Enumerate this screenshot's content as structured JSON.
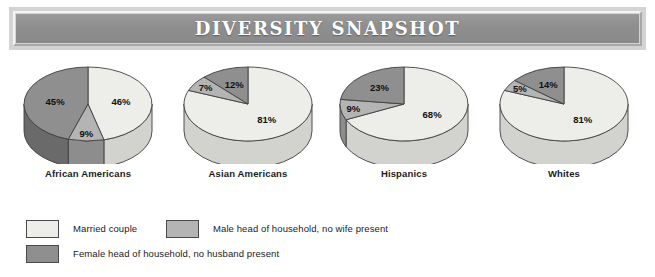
{
  "banner": {
    "title": "DIVERSITY SNAPSHOT"
  },
  "colors": {
    "married_couple": "#ededea",
    "male_head": "#b4b4b4",
    "female_head": "#8f8f8f",
    "married_couple_side": "#d2d2cf",
    "male_head_side": "#8d8d8d",
    "female_head_side": "#6a6a6a",
    "outline": "#3f3f3f",
    "banner_fill": "#8e8e8e",
    "banner_frame": "#d3d3d3",
    "title_text": "#ffffff",
    "background": "#ffffff"
  },
  "legend": {
    "items": [
      {
        "label": "Married couple",
        "swatch": "#ededea",
        "series_key": "married_couple"
      },
      {
        "label": "Male head of household, no wife present",
        "swatch": "#b4b4b4",
        "series_key": "male_head"
      },
      {
        "label": "Female head of household, no husband present",
        "swatch": "#8f8f8f",
        "series_key": "female_head"
      }
    ]
  },
  "chart_data": {
    "type": "pie",
    "title": "DIVERSITY SNAPSHOT",
    "xlabel": "",
    "ylabel": "",
    "units": "percent",
    "legend_position": "bottom-left",
    "grid": false,
    "categories": [
      "Married couple",
      "Male head of household, no wife present",
      "Female head of household, no husband present"
    ],
    "pies": [
      {
        "label": "African Americans",
        "slices": [
          {
            "name": "Married couple",
            "value": 46,
            "display": "46%"
          },
          {
            "name": "Male head of household, no wife present",
            "value": 9,
            "display": "9%"
          },
          {
            "name": "Female head of household, no husband present",
            "value": 45,
            "display": "45%"
          }
        ]
      },
      {
        "label": "Asian Americans",
        "slices": [
          {
            "name": "Married couple",
            "value": 81,
            "display": "81%"
          },
          {
            "name": "Male head of household, no wife present",
            "value": 7,
            "display": "7%"
          },
          {
            "name": "Female head of household, no husband present",
            "value": 12,
            "display": "12%"
          }
        ]
      },
      {
        "label": "Hispanics",
        "slices": [
          {
            "name": "Married couple",
            "value": 68,
            "display": "68%"
          },
          {
            "name": "Male head of household, no wife present",
            "value": 9,
            "display": "9%"
          },
          {
            "name": "Female head of household, no husband present",
            "value": 23,
            "display": "23%"
          }
        ]
      },
      {
        "label": "Whites",
        "slices": [
          {
            "name": "Married couple",
            "value": 81,
            "display": "81%"
          },
          {
            "name": "Male head of household, no wife present",
            "value": 5,
            "display": "5%"
          },
          {
            "name": "Female head of household, no husband present",
            "value": 14,
            "display": "14%"
          }
        ]
      }
    ]
  }
}
